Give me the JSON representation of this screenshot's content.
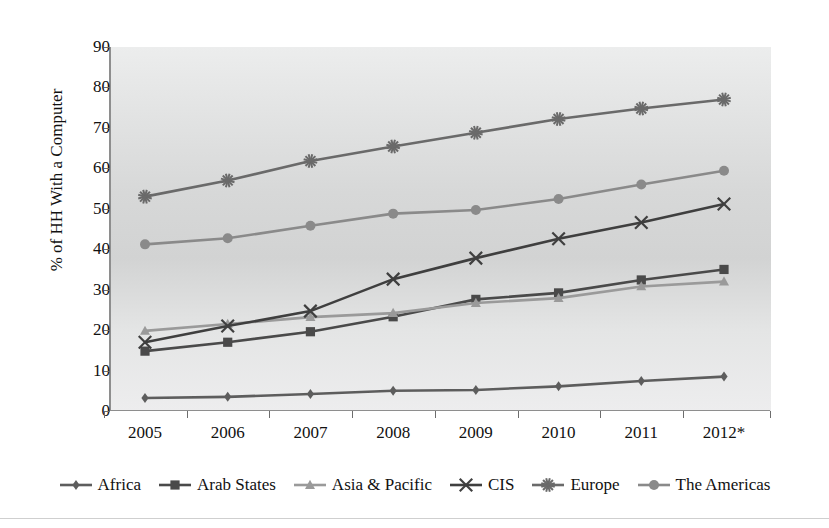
{
  "chart_data": {
    "type": "line",
    "title": "",
    "subtitle": "",
    "xlabel": "",
    "ylabel": "% of HH With a Computer",
    "categories": [
      "2005",
      "2006",
      "2007",
      "2008",
      "2009",
      "2010",
      "2011",
      "2012*"
    ],
    "x": [
      2005,
      2006,
      2007,
      2008,
      2009,
      2010,
      2011,
      2012
    ],
    "ylim": [
      0,
      90
    ],
    "ytick_labels": [
      "0",
      "10",
      "20",
      "30",
      "40",
      "50",
      "60",
      "70",
      "80",
      "90"
    ],
    "ytick_values": [
      0,
      10,
      20,
      30,
      40,
      50,
      60,
      70,
      80,
      90
    ],
    "grid": false,
    "legend_position": "bottom",
    "series": [
      {
        "name": "Africa",
        "marker": "diamond",
        "color": "#5d5d5d",
        "values": [
          3.2,
          3.5,
          4.2,
          5.0,
          5.2,
          6.1,
          7.4,
          8.5
        ]
      },
      {
        "name": "Arab States",
        "marker": "square",
        "color": "#4a4a4a",
        "values": [
          14.8,
          17.0,
          19.6,
          23.3,
          27.6,
          29.2,
          32.4,
          35.0
        ]
      },
      {
        "name": "Asia & Pacific",
        "marker": "triangle",
        "color": "#9a9a9a",
        "values": [
          19.8,
          21.5,
          23.2,
          24.2,
          26.7,
          27.9,
          30.8,
          32.0
        ]
      },
      {
        "name": "CIS",
        "marker": "x",
        "color": "#3f3f3f",
        "values": [
          17.0,
          21.0,
          24.7,
          32.6,
          37.8,
          42.6,
          46.6,
          51.2
        ]
      },
      {
        "name": "Europe",
        "marker": "star",
        "color": "#6a6a6a",
        "values": [
          53.0,
          57.0,
          61.8,
          65.4,
          68.8,
          72.2,
          74.8,
          77.0
        ]
      },
      {
        "name": "The Americas",
        "marker": "circle",
        "color": "#8a8a8a",
        "values": [
          41.2,
          42.7,
          45.8,
          48.8,
          49.7,
          52.4,
          56.0,
          59.4
        ]
      }
    ]
  }
}
